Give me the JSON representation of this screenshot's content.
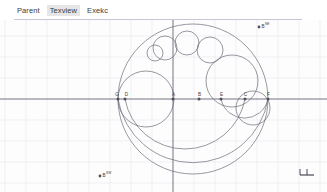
{
  "window": {
    "title": "Geometry Construction"
  },
  "menubar": {
    "items": [
      {
        "label": "Parent",
        "highlighted": false
      },
      {
        "label": "Texview",
        "highlighted": true
      },
      {
        "label": "Exekc",
        "highlighted": false
      }
    ]
  },
  "canvas": {
    "background_color": "#fdfdfd",
    "grid": {
      "visible": true,
      "spacing": 21,
      "minor_color": "#e9e9f0",
      "major_color": "#dcdce6"
    },
    "axes": {
      "visible": true,
      "color": "#7a7a86",
      "origin_x": 173,
      "origin_y": 99,
      "x_axis_label": "",
      "y_axis_label": ""
    },
    "stroke_color": "#6b6b78",
    "point_color": "#50505c"
  },
  "points": [
    {
      "name": "G",
      "label": "G",
      "x": 118,
      "y": 99,
      "label_dx": -1,
      "label_dy": -3.5
    },
    {
      "name": "D",
      "label": "D",
      "x": 125,
      "y": 99,
      "label_dx": 1.5,
      "label_dy": -3.5
    },
    {
      "name": "A",
      "label": "A",
      "x": 173,
      "y": 99,
      "label_dx": 0.5,
      "label_dy": -3.5
    },
    {
      "name": "B",
      "label": "B",
      "x": 199,
      "y": 99,
      "label_dx": 0.5,
      "label_dy": -3.5
    },
    {
      "name": "E",
      "label": "E",
      "x": 221,
      "y": 99,
      "label_dx": 0.5,
      "label_dy": -3.5
    },
    {
      "name": "C",
      "label": "C",
      "x": 245,
      "y": 99,
      "label_dx": 0.5,
      "label_dy": -3.5
    },
    {
      "name": "F",
      "label": "F",
      "x": 268,
      "y": 99,
      "label_dx": 0.5,
      "label_dy": -3.5
    }
  ],
  "annotated_points": [
    {
      "name": "B-northeast",
      "base": "B",
      "sup": "NE",
      "x": 259,
      "y": 27
    },
    {
      "name": "B-southwest",
      "base": "B",
      "sup": "SW",
      "x": 100,
      "y": 176
    }
  ],
  "circles": [
    {
      "name": "outer-arbelos-circle",
      "cx": 193,
      "cy": 99,
      "r": 75
    },
    {
      "name": "left-small-semicircle-arc",
      "cx": 146,
      "cy": 99,
      "r": 28
    },
    {
      "name": "right-chain-circle-large",
      "cx": 232,
      "cy": 81,
      "r": 26
    },
    {
      "name": "chain-circle-1",
      "cx": 165,
      "cy": 48,
      "r": 12
    },
    {
      "name": "chain-circle-2",
      "cx": 187,
      "cy": 43,
      "r": 12
    },
    {
      "name": "chain-circle-3",
      "cx": 210,
      "cy": 50,
      "r": 13
    },
    {
      "name": "chain-circle-4",
      "cx": 253,
      "cy": 108,
      "r": 17
    },
    {
      "name": "chain-circle-small-left",
      "cx": 155,
      "cy": 53,
      "r": 8
    }
  ],
  "arcs": [
    {
      "name": "lower-arc-G-to-F",
      "start_x": 118,
      "start_y": 99,
      "end_x": 268,
      "end_y": 99,
      "r": 76
    },
    {
      "name": "lower-arc-D-to-C",
      "start_x": 125,
      "start_y": 99,
      "end_x": 245,
      "end_y": 99,
      "r": 61
    },
    {
      "name": "lower-arc-E-to-C-small",
      "start_x": 221,
      "start_y": 99,
      "end_x": 268,
      "end_y": 99,
      "r": 24
    }
  ],
  "scalebar": {
    "name": "scale-bar",
    "x": 300,
    "y": 169,
    "width": 14,
    "label": ""
  }
}
